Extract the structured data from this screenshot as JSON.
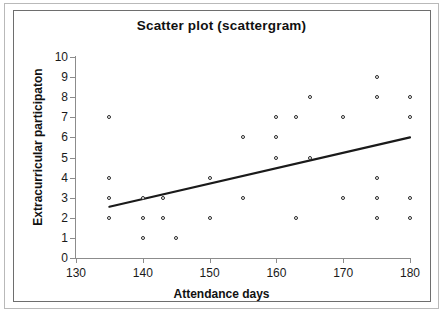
{
  "chart_data": {
    "type": "scatter",
    "title": "Scatter plot (scattergram)",
    "xlabel": "Attendance days",
    "ylabel": "Extracurricular participaton",
    "xlim": [
      130,
      180
    ],
    "ylim": [
      0,
      10
    ],
    "xticks": [
      130,
      140,
      150,
      160,
      170,
      180
    ],
    "yticks": [
      0,
      1,
      2,
      3,
      4,
      5,
      6,
      7,
      8,
      9,
      10
    ],
    "grid": false,
    "legend": "none",
    "marker": "open-circle",
    "points": [
      {
        "x": 135,
        "y": 7
      },
      {
        "x": 135,
        "y": 4
      },
      {
        "x": 135,
        "y": 3
      },
      {
        "x": 135,
        "y": 2
      },
      {
        "x": 140,
        "y": 3
      },
      {
        "x": 140,
        "y": 2
      },
      {
        "x": 140,
        "y": 1
      },
      {
        "x": 143,
        "y": 3
      },
      {
        "x": 143,
        "y": 2
      },
      {
        "x": 145,
        "y": 1
      },
      {
        "x": 150,
        "y": 4
      },
      {
        "x": 150,
        "y": 2
      },
      {
        "x": 155,
        "y": 6
      },
      {
        "x": 155,
        "y": 3
      },
      {
        "x": 160,
        "y": 7
      },
      {
        "x": 160,
        "y": 6
      },
      {
        "x": 160,
        "y": 5
      },
      {
        "x": 163,
        "y": 7
      },
      {
        "x": 163,
        "y": 2
      },
      {
        "x": 165,
        "y": 8
      },
      {
        "x": 165,
        "y": 5
      },
      {
        "x": 170,
        "y": 7
      },
      {
        "x": 170,
        "y": 3
      },
      {
        "x": 175,
        "y": 9
      },
      {
        "x": 175,
        "y": 8
      },
      {
        "x": 175,
        "y": 4
      },
      {
        "x": 175,
        "y": 3
      },
      {
        "x": 175,
        "y": 2
      },
      {
        "x": 180,
        "y": 8
      },
      {
        "x": 180,
        "y": 7
      },
      {
        "x": 180,
        "y": 3
      },
      {
        "x": 180,
        "y": 2
      }
    ],
    "trendline": {
      "type": "linear",
      "x_start": 135,
      "y_start": 2.55,
      "x_end": 180,
      "y_end": 6.0,
      "color": "#1a1a1a"
    }
  }
}
